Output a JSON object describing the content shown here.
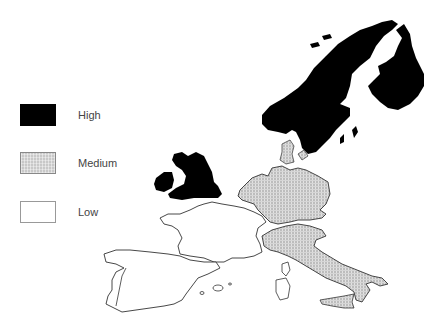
{
  "legend": {
    "items": [
      {
        "category": "high",
        "label": "High",
        "color": "#000000"
      },
      {
        "category": "medium",
        "label": "Medium",
        "color": "#c8c8c8",
        "pattern": "cross-hatch"
      },
      {
        "category": "low",
        "label": "Low",
        "color": "#ffffff"
      }
    ]
  },
  "map": {
    "region": "Western Europe",
    "countries": [
      {
        "name": "Norway",
        "category": "high"
      },
      {
        "name": "Sweden",
        "category": "high"
      },
      {
        "name": "Finland",
        "category": "high"
      },
      {
        "name": "United Kingdom",
        "category": "high"
      },
      {
        "name": "Ireland",
        "category": "high"
      },
      {
        "name": "Denmark",
        "category": "medium"
      },
      {
        "name": "Germany",
        "category": "medium"
      },
      {
        "name": "Netherlands",
        "category": "medium"
      },
      {
        "name": "Italy",
        "category": "medium"
      },
      {
        "name": "Sicily",
        "category": "medium"
      },
      {
        "name": "France",
        "category": "low"
      },
      {
        "name": "Spain",
        "category": "low"
      },
      {
        "name": "Portugal",
        "category": "low"
      },
      {
        "name": "Corsica",
        "category": "low"
      },
      {
        "name": "Sardinia",
        "category": "low"
      },
      {
        "name": "Balearic Islands",
        "category": "low"
      }
    ]
  },
  "caption": ""
}
